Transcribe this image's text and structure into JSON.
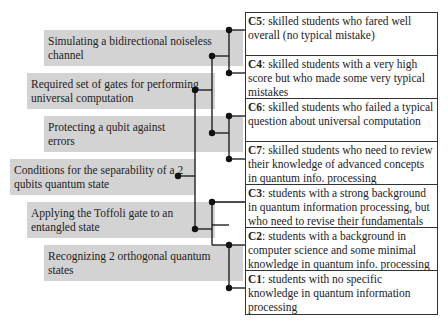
{
  "questions": [
    {
      "id": "q1",
      "text": "Simulating a bidirectional noiseless channel"
    },
    {
      "id": "q2",
      "text": "Required set of gates for performing universal computation"
    },
    {
      "id": "q3",
      "text": "Protecting a qubit against errors"
    },
    {
      "id": "q4",
      "text": "Conditions for the separability of a 2 qubits quantum state"
    },
    {
      "id": "q5",
      "text": "Applying the Toffoli gate to an entangled state"
    },
    {
      "id": "q6",
      "text": "Recognizing 2 orthogonal quantum states"
    }
  ],
  "clusters": [
    {
      "code": "C5",
      "desc": ": skilled students who fared well overall (no typical mistake)"
    },
    {
      "code": "C4",
      "desc": ": skilled students with a very high score but who made some very typical mistakes"
    },
    {
      "code": "C6",
      "desc": ": skilled students who failed a typical question about universal computation"
    },
    {
      "code": "C7",
      "desc": ": skilled students who need to review their knowledge of advanced concepts in quantum info. processing"
    },
    {
      "code": "C3",
      "desc": ": students with a strong background in quantum information processing, but who need to revise their fundamentals"
    },
    {
      "code": "C2",
      "desc": ": students with a background in computer science and some minimal knowledge in quantum info. processing"
    },
    {
      "code": "C1",
      "desc": ": students with no specific knowledge in quantum information processing"
    }
  ]
}
